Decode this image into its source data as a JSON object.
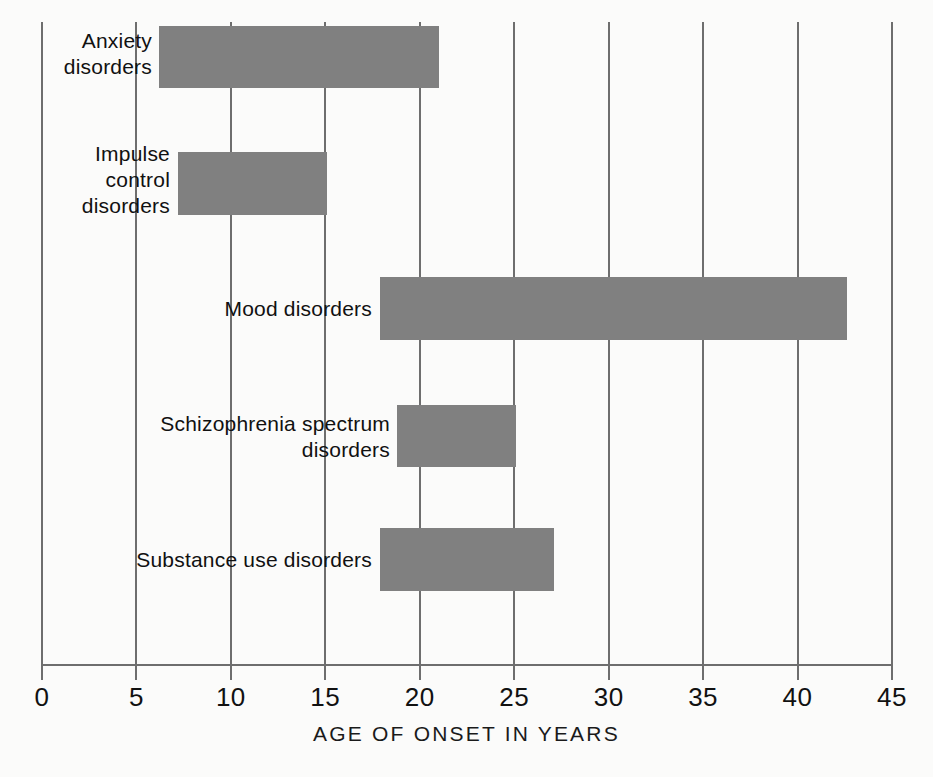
{
  "chart_data": {
    "type": "bar",
    "orientation": "horizontal",
    "subtype": "range-bar",
    "title": "",
    "xlabel": "AGE OF ONSET IN YEARS",
    "ylabel": "",
    "xlim": [
      0,
      45
    ],
    "xticks": [
      0,
      5,
      10,
      15,
      20,
      25,
      30,
      35,
      40,
      45
    ],
    "xtick_labels": [
      "0",
      "5",
      "10",
      "15",
      "20",
      "25",
      "30",
      "35",
      "40",
      "45"
    ],
    "grid": true,
    "grid_axis": "x",
    "legend": false,
    "bar_color": "#808080",
    "grid_color": "#6e6e6e",
    "background_color": "#fbfbfa",
    "categories": [
      "Anxiety disorders",
      "Impulse control disorders",
      "Mood disorders",
      "Schizophrenia spectrum disorders",
      "Substance use disorders"
    ],
    "ranges": [
      {
        "label": "Anxiety disorders",
        "start": 6.2,
        "end": 21.0
      },
      {
        "label": "Impulse control disorders",
        "start": 7.2,
        "end": 15.1
      },
      {
        "label": "Mood disorders",
        "start": 17.9,
        "end": 42.6
      },
      {
        "label": "Schizophrenia spectrum disorders",
        "start": 18.8,
        "end": 25.1
      },
      {
        "label": "Substance use disorders",
        "start": 17.9,
        "end": 27.1
      }
    ]
  },
  "bars": [
    {
      "name": "anxiety-disorders",
      "label": "Anxiety\ndisorders",
      "start": 6.2,
      "end": 21.0,
      "top": 26,
      "height": 62,
      "label_left": 20,
      "label_width": 132,
      "label_top": 28
    },
    {
      "name": "impulse-control-disorders",
      "label": "Impulse\ncontrol\ndisorders",
      "start": 7.2,
      "end": 15.1,
      "top": 152,
      "height": 63,
      "label_left": 38,
      "label_width": 132,
      "label_top": 141
    },
    {
      "name": "mood-disorders",
      "label": "Mood disorders",
      "start": 17.9,
      "end": 42.6,
      "top": 277,
      "height": 63,
      "label_left": 150,
      "label_width": 222,
      "label_top": 296
    },
    {
      "name": "schizophrenia-spectrum-disorders",
      "label": "Schizophrenia spectrum\ndisorders",
      "start": 18.8,
      "end": 25.1,
      "top": 405,
      "height": 62,
      "label_left": 88,
      "label_width": 302,
      "label_top": 411
    },
    {
      "name": "substance-use-disorders",
      "label": "Substance use disorders",
      "start": 17.9,
      "end": 27.1,
      "top": 528,
      "height": 63,
      "label_left": 110,
      "label_width": 262,
      "label_top": 547
    }
  ],
  "axis": {
    "title": "AGE OF ONSET IN YEARS",
    "ticks": [
      "0",
      "5",
      "10",
      "15",
      "20",
      "25",
      "30",
      "35",
      "40",
      "45"
    ]
  }
}
